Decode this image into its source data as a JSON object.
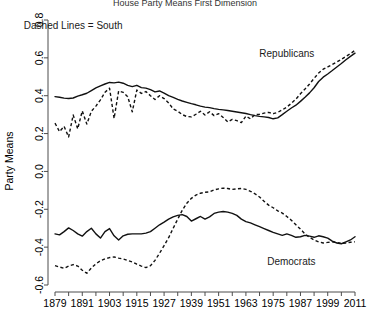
{
  "chart_data": {
    "type": "line",
    "title": "House Party Means First Dimension",
    "xlabel": "",
    "ylabel": "Party Means",
    "xlim": [
      1879,
      2011
    ],
    "ylim": [
      -0.6,
      0.8
    ],
    "grid": false,
    "legend": "inline-annotations",
    "x_ticks": [
      1879,
      1891,
      1903,
      1915,
      1927,
      1939,
      1951,
      1963,
      1975,
      1987,
      1999,
      2011
    ],
    "x_minor_tick_step": 6,
    "y_ticks": [
      -0.6,
      -0.4,
      -0.2,
      0.0,
      0.2,
      0.4,
      0.6,
      0.8
    ],
    "annotations": [
      {
        "text": "Dashed Lines = South",
        "x": 1887,
        "y": 0.755
      },
      {
        "text": "Republicans",
        "x": 1981,
        "y": 0.605
      },
      {
        "text": "Democrats",
        "x": 1983,
        "y": -0.495
      }
    ],
    "x": [
      1879,
      1881,
      1883,
      1885,
      1887,
      1889,
      1891,
      1893,
      1895,
      1897,
      1899,
      1901,
      1903,
      1905,
      1907,
      1909,
      1911,
      1913,
      1915,
      1917,
      1919,
      1921,
      1923,
      1925,
      1927,
      1929,
      1931,
      1933,
      1935,
      1937,
      1939,
      1941,
      1943,
      1945,
      1947,
      1949,
      1951,
      1953,
      1955,
      1957,
      1959,
      1961,
      1963,
      1965,
      1967,
      1969,
      1971,
      1973,
      1975,
      1977,
      1979,
      1981,
      1983,
      1985,
      1987,
      1989,
      1991,
      1993,
      1995,
      1997,
      1999,
      2001,
      2003,
      2005,
      2007,
      2009,
      2011
    ],
    "series": [
      {
        "name": "Republicans (Non-South)",
        "style": "solid",
        "values": [
          0.395,
          0.392,
          0.387,
          0.385,
          0.388,
          0.398,
          0.405,
          0.413,
          0.427,
          0.441,
          0.452,
          0.462,
          0.47,
          0.468,
          0.472,
          0.466,
          0.455,
          0.448,
          0.455,
          0.443,
          0.44,
          0.432,
          0.42,
          0.425,
          0.414,
          0.4,
          0.391,
          0.381,
          0.372,
          0.365,
          0.358,
          0.352,
          0.345,
          0.34,
          0.337,
          0.332,
          0.328,
          0.325,
          0.322,
          0.318,
          0.314,
          0.31,
          0.306,
          0.3,
          0.295,
          0.291,
          0.288,
          0.285,
          0.278,
          0.283,
          0.3,
          0.318,
          0.335,
          0.35,
          0.37,
          0.392,
          0.415,
          0.442,
          0.475,
          0.498,
          0.515,
          0.533,
          0.552,
          0.57,
          0.59,
          0.608,
          0.625
        ]
      },
      {
        "name": "Republicans (South)",
        "style": "dashed",
        "values": [
          0.255,
          0.21,
          0.238,
          0.182,
          0.298,
          0.225,
          0.32,
          0.25,
          0.318,
          0.345,
          0.378,
          0.418,
          0.44,
          0.28,
          0.425,
          0.418,
          0.395,
          0.315,
          0.43,
          0.412,
          0.422,
          0.4,
          0.38,
          0.4,
          0.385,
          0.362,
          0.33,
          0.318,
          0.3,
          0.29,
          0.288,
          0.302,
          0.318,
          0.298,
          0.315,
          0.295,
          0.305,
          0.285,
          0.262,
          0.275,
          0.268,
          0.258,
          0.292,
          0.278,
          0.3,
          0.302,
          0.308,
          0.312,
          0.305,
          0.312,
          0.325,
          0.34,
          0.36,
          0.382,
          0.41,
          0.435,
          0.462,
          0.492,
          0.52,
          0.54,
          0.552,
          0.565,
          0.578,
          0.592,
          0.608,
          0.622,
          0.64
        ]
      },
      {
        "name": "Democrats (Non-South)",
        "style": "solid",
        "values": [
          -0.33,
          -0.335,
          -0.318,
          -0.298,
          -0.312,
          -0.33,
          -0.342,
          -0.318,
          -0.3,
          -0.33,
          -0.352,
          -0.318,
          -0.302,
          -0.34,
          -0.362,
          -0.34,
          -0.332,
          -0.33,
          -0.33,
          -0.33,
          -0.326,
          -0.318,
          -0.3,
          -0.282,
          -0.268,
          -0.252,
          -0.24,
          -0.232,
          -0.228,
          -0.238,
          -0.262,
          -0.25,
          -0.238,
          -0.252,
          -0.24,
          -0.222,
          -0.215,
          -0.212,
          -0.215,
          -0.222,
          -0.232,
          -0.252,
          -0.265,
          -0.272,
          -0.282,
          -0.292,
          -0.302,
          -0.312,
          -0.322,
          -0.33,
          -0.338,
          -0.33,
          -0.338,
          -0.348,
          -0.345,
          -0.338,
          -0.342,
          -0.348,
          -0.34,
          -0.345,
          -0.352,
          -0.368,
          -0.378,
          -0.382,
          -0.372,
          -0.362,
          -0.345
        ]
      },
      {
        "name": "Democrats (South)",
        "style": "dashed",
        "values": [
          -0.498,
          -0.505,
          -0.512,
          -0.5,
          -0.492,
          -0.5,
          -0.522,
          -0.538,
          -0.51,
          -0.488,
          -0.472,
          -0.462,
          -0.455,
          -0.452,
          -0.458,
          -0.462,
          -0.47,
          -0.478,
          -0.49,
          -0.5,
          -0.508,
          -0.498,
          -0.47,
          -0.432,
          -0.392,
          -0.35,
          -0.3,
          -0.252,
          -0.205,
          -0.168,
          -0.142,
          -0.125,
          -0.115,
          -0.11,
          -0.108,
          -0.098,
          -0.092,
          -0.088,
          -0.09,
          -0.095,
          -0.092,
          -0.09,
          -0.095,
          -0.105,
          -0.118,
          -0.135,
          -0.158,
          -0.178,
          -0.192,
          -0.208,
          -0.22,
          -0.238,
          -0.258,
          -0.282,
          -0.305,
          -0.33,
          -0.348,
          -0.362,
          -0.372,
          -0.378,
          -0.375,
          -0.372,
          -0.376,
          -0.38,
          -0.378,
          -0.374,
          -0.372
        ]
      }
    ]
  }
}
